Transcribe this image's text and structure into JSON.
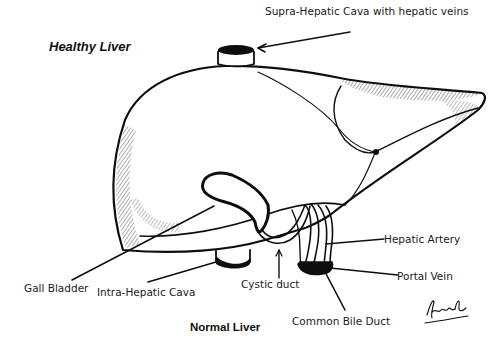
{
  "title": "Healthy Liver",
  "caption": "Normal Liver",
  "labels": {
    "supra_hepatic_cava": "Supra-Hepatic Cava with hepatic veins",
    "hepatic_artery": "Hepatic Artery",
    "portal_vein": "Portal Vein",
    "gall_bladder": "Gall Bladder",
    "intra_hepatic_cava": "Intra-Hepatic Cava",
    "cystic_duct": "Cystic duct",
    "common_bile_duct": "Common Bile Duct"
  },
  "signature": "artist-signature",
  "colors": {
    "ink": "#111111",
    "background": "#ffffff"
  }
}
